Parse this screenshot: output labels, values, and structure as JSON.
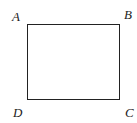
{
  "diagram": {
    "shape": "rectangle",
    "stroke_color": "#222222",
    "vertices": [
      {
        "label": "A",
        "position": "top-left"
      },
      {
        "label": "B",
        "position": "top-right"
      },
      {
        "label": "C",
        "position": "bottom-right"
      },
      {
        "label": "D",
        "position": "bottom-left"
      }
    ]
  }
}
